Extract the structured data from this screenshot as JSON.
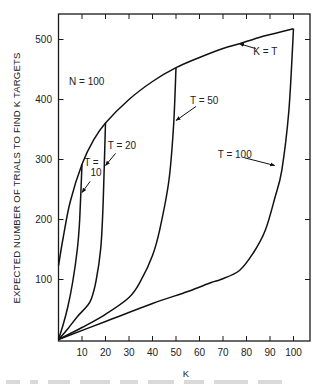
{
  "chart_data": {
    "type": "line",
    "title": "",
    "xlabel": "K",
    "ylabel": "EXPECTED NUMBER OF TRIALS TO FIND K TARGETS",
    "xlim": [
      0,
      100
    ],
    "ylim": [
      0,
      530
    ],
    "grid": false,
    "x_ticks": [
      10,
      20,
      30,
      40,
      50,
      60,
      70,
      80,
      90,
      100
    ],
    "x_tick_labels": [
      "10",
      "20",
      "30",
      "40",
      "50",
      "60",
      "70",
      "80",
      "90",
      "100"
    ],
    "y_ticks": [
      100,
      200,
      300,
      400,
      500
    ],
    "y_tick_labels": [
      "100",
      "200",
      "300",
      "400",
      "500"
    ],
    "annotations": [
      {
        "text": "N = 100",
        "x": 12,
        "y": 425
      },
      {
        "text": "K = T",
        "x": 88,
        "y": 475,
        "arrow_to": [
          77,
          493
        ]
      },
      {
        "text": "T = 20",
        "x": 27,
        "y": 318,
        "arrow_to": [
          20,
          290
        ]
      },
      {
        "text": "T =",
        "x": 14,
        "y": 290
      },
      {
        "text": "10",
        "x": 16,
        "y": 272,
        "arrow_to": [
          10,
          245
        ]
      },
      {
        "text": "T = 50",
        "x": 62,
        "y": 393,
        "arrow_to": [
          50,
          365
        ]
      },
      {
        "text": "T = 100",
        "x": 75,
        "y": 302,
        "arrow_to": [
          92,
          290
        ]
      }
    ],
    "series": [
      {
        "name": "K = T",
        "x": [
          0,
          2,
          5,
          10,
          15,
          20,
          30,
          40,
          50,
          60,
          70,
          77,
          85,
          92,
          100
        ],
        "y": [
          123,
          170,
          230,
          292,
          333,
          361,
          400,
          430,
          453,
          470,
          485,
          493,
          503,
          510,
          518
        ]
      },
      {
        "name": "T = 10",
        "x": [
          0,
          2,
          4,
          6,
          8,
          9,
          10
        ],
        "y": [
          0,
          25,
          55,
          95,
          150,
          200,
          292
        ]
      },
      {
        "name": "T = 20",
        "x": [
          0,
          4,
          8,
          12,
          14,
          16,
          18,
          19,
          20
        ],
        "y": [
          0,
          18,
          38,
          55,
          68,
          98,
          153,
          230,
          361
        ]
      },
      {
        "name": "T = 50",
        "x": [
          0,
          10,
          20,
          30,
          35,
          40,
          43,
          47,
          49,
          50
        ],
        "y": [
          0,
          20,
          42,
          70,
          98,
          140,
          182,
          265,
          360,
          453
        ]
      },
      {
        "name": "T = 100",
        "x": [
          0,
          20,
          40,
          55,
          65,
          69,
          77,
          83,
          88,
          92,
          95,
          98,
          100
        ],
        "y": [
          0,
          30,
          60,
          80,
          95,
          100,
          115,
          145,
          182,
          235,
          282,
          380,
          518
        ]
      }
    ]
  },
  "caption": {
    "visible_text": ""
  }
}
